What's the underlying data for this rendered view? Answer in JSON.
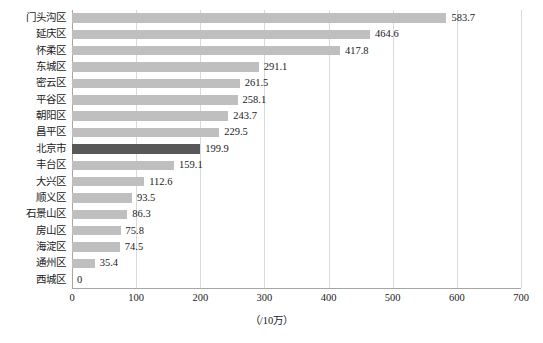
{
  "chart_data": {
    "type": "bar",
    "orientation": "horizontal",
    "title": "",
    "subtitle": "",
    "xlabel": "（/10万）",
    "ylabel": "",
    "xlim": [
      0,
      700
    ],
    "xticks": [
      0,
      100,
      200,
      300,
      400,
      500,
      600,
      700
    ],
    "xtick_labels": [
      "0",
      "100",
      "200",
      "300",
      "400",
      "500",
      "600",
      "700"
    ],
    "grid": "vertical",
    "legend": "none",
    "categories": [
      "门头沟区",
      "延庆区",
      "怀柔区",
      "东城区",
      "密云区",
      "平谷区",
      "朝阳区",
      "昌平区",
      "北京市",
      "丰台区",
      "大兴区",
      "顺义区",
      "石景山区",
      "房山区",
      "海淀区",
      "通州区",
      "西城区"
    ],
    "values": [
      583.7,
      464.6,
      417.8,
      291.1,
      261.5,
      258.1,
      243.7,
      229.5,
      199.9,
      159.1,
      112.6,
      93.5,
      86.3,
      75.8,
      74.5,
      35.4,
      0
    ],
    "value_labels": [
      "583.7",
      "464.6",
      "417.8",
      "291.1",
      "261.5",
      "258.1",
      "243.7",
      "229.5",
      "199.9",
      "159.1",
      "112.6",
      "93.5",
      "86.3",
      "75.8",
      "74.5",
      "35.4",
      "0"
    ],
    "highlight_category": "北京市",
    "colors": {
      "bar": "#bfbfbf",
      "bar_highlight": "#585858",
      "gridline": "#d9d9d9",
      "axis": "#a6a6a6",
      "text": "#1a1a1a",
      "background": "#ffffff"
    }
  }
}
